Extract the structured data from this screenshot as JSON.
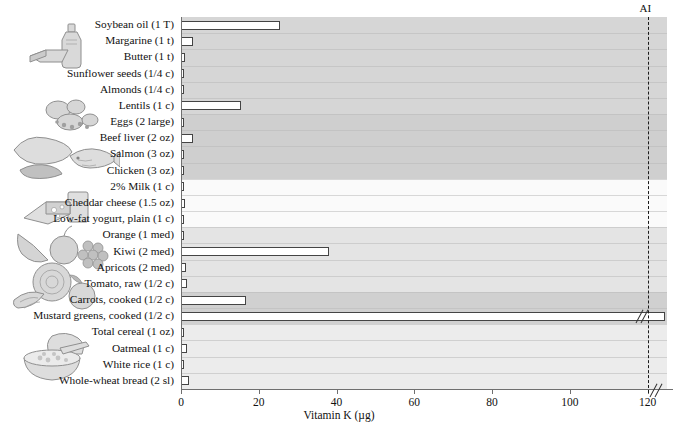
{
  "chart_data": {
    "type": "bar",
    "orientation": "horizontal",
    "title": "",
    "xlabel": "Vitamin K (µg)",
    "ylabel": "",
    "xlim": [
      0,
      125
    ],
    "xticks": [
      0,
      20,
      40,
      60,
      80,
      100,
      120
    ],
    "xticklabels": [
      "0",
      "20",
      "40",
      "60",
      "80",
      "100",
      "120"
    ],
    "grid": false,
    "legend": "none",
    "annotations": [
      {
        "name": "AI",
        "label": "AI",
        "value": 120,
        "style": "vertical-dashed-line"
      }
    ],
    "axis_break": {
      "present": true,
      "after": 120,
      "note": "bar exceeds axis maximum"
    },
    "categories": [
      "Soybean oil (1 T)",
      "Margarine (1 t)",
      "Butter (1 t)",
      "Sunflower seeds (1/4 c)",
      "Almonds (1/4 c)",
      "Lentils (1 c)",
      "Eggs (2 large)",
      "Beef liver (2 oz)",
      "Salmon (3 oz)",
      "Chicken (3 oz)",
      "2% Milk (1 c)",
      "Cheddar cheese (1.5 oz)",
      "Low-fat yogurt, plain (1 c)",
      "Orange (1 med)",
      "Kiwi (2 med)",
      "Apricots (2 med)",
      "Tomato, raw (1/2 c)",
      "Carrots, cooked (1/2 c)",
      "Mustard greens, cooked (1/2 c)",
      "Total cereal (1 oz)",
      "Oatmeal (1 c)",
      "White rice (1 c)",
      "Whole-wheat bread (2 sl)"
    ],
    "values": [
      25.5,
      3.0,
      1.0,
      0.4,
      0.3,
      15.5,
      0.6,
      3.2,
      0.5,
      0.3,
      0.5,
      1.0,
      0.4,
      0.3,
      38.0,
      1.4,
      1.6,
      16.8,
      128.0,
      0.3,
      1.6,
      0.2,
      2.0
    ],
    "value_unit": "µg",
    "broken_bars": [
      18
    ],
    "groups": [
      {
        "name": "fats-oils-nuts-legumes",
        "shade": "#d6d6d6",
        "from": 0,
        "to": 5
      },
      {
        "name": "protein-foods",
        "shade": "#cfcfcf",
        "from": 6,
        "to": 9
      },
      {
        "name": "dairy",
        "shade": "#fafafa",
        "from": 10,
        "to": 12
      },
      {
        "name": "fruits",
        "shade": "#e4e4e4",
        "from": 13,
        "to": 16
      },
      {
        "name": "vegetables",
        "shade": "#d0d0d0",
        "from": 17,
        "to": 18
      },
      {
        "name": "grains",
        "shade": "#ececec",
        "from": 19,
        "to": 22
      }
    ]
  },
  "colors": {
    "bar_fill": "#ffffff",
    "bar_stroke": "#444444",
    "axis": "#6f6f6f",
    "ai_line": "#1a1a1a",
    "text": "#111111",
    "background": "#ffffff"
  },
  "illustrations": [
    {
      "name": "oil-bottle-and-butter",
      "group": "fats-oils-nuts-legumes"
    },
    {
      "name": "lentils-and-nuts",
      "group": "fats-oils-nuts-legumes"
    },
    {
      "name": "meat-fish-poultry",
      "group": "protein-foods"
    },
    {
      "name": "cheese-and-milk-glass",
      "group": "dairy"
    },
    {
      "name": "fruits-apple-grapes-banana",
      "group": "fruits"
    },
    {
      "name": "vegetables-cabbage-tomato-carrot",
      "group": "vegetables"
    },
    {
      "name": "bread-and-oatmeal-bowl",
      "group": "grains"
    }
  ]
}
